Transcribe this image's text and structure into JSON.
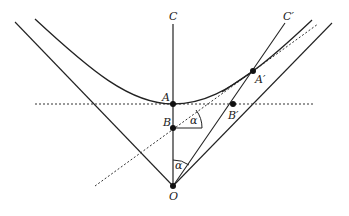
{
  "diagram": {
    "labels": {
      "C": "C",
      "C_prime": "C′",
      "A": "A",
      "A_prime": "A′",
      "B": "B",
      "B_prime": "B′",
      "O": "O",
      "alpha_top": "α",
      "alpha_bottom": "α"
    },
    "points": {
      "O": [
        173,
        186
      ],
      "A": [
        173,
        104
      ],
      "B": [
        173,
        128
      ],
      "A_prime": [
        253,
        71
      ],
      "B_prime": [
        233,
        104
      ]
    },
    "colors": {
      "line": "#222222",
      "background": "#ffffff"
    }
  }
}
